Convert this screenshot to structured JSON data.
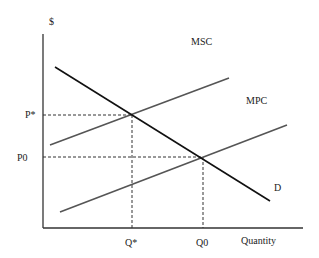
{
  "diagram": {
    "type": "supply-demand-externality",
    "y_axis_label": "$",
    "x_axis_label": "Quantity",
    "curves": [
      {
        "name": "MSC",
        "label": "MSC",
        "color": "#555555"
      },
      {
        "name": "MPC",
        "label": "MPC",
        "color": "#555555"
      },
      {
        "name": "D",
        "label": "D",
        "color": "#111111"
      }
    ],
    "price_labels": {
      "p_star": "P*",
      "p_zero": "P0"
    },
    "quantity_labels": {
      "q_star": "Q*",
      "q_zero": "Q0"
    },
    "colors": {
      "axis": "#333333",
      "demand": "#111111",
      "supply": "#555555",
      "dashed": "#333333",
      "text": "#222222"
    }
  }
}
